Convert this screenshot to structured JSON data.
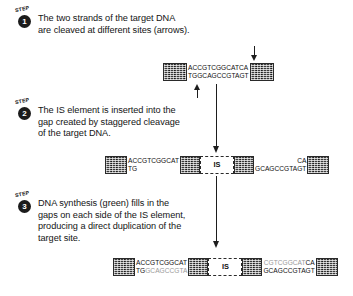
{
  "diagram": {
    "step_word": "STEP",
    "is_label": "IS",
    "accent_color": "#1b1b1b",
    "synthesis_color": "#9a9a9a"
  },
  "steps": [
    {
      "number": "1",
      "text": "The two strands of the target DNA\nare cleaved at different sites (arrows).",
      "dna": {
        "left_block": "target-dna-block",
        "sequence_top": "ACCGTCGGCATCA",
        "sequence_bottom": "TGGCAGCCGTAGT",
        "right_block": "target-dna-block"
      },
      "annotations": {
        "top_arrow": "cleavage-site-top-strand",
        "bottom_arrow": "cleavage-site-bottom-strand"
      }
    },
    {
      "number": "2",
      "text": "The IS element is inserted into the\ngap created by staggered cleavage\nof the target DNA.",
      "dna": {
        "left_block": "target-dna-block",
        "left_top": "ACCGTCGGCAT",
        "left_bottom": "TG",
        "is_left_flank": "is-inverted-repeat",
        "is_label": "IS",
        "is_right_flank": "is-inverted-repeat",
        "right_top": "CA",
        "right_bottom": "GCAGCCGTAGT",
        "right_block": "target-dna-block"
      }
    },
    {
      "number": "3",
      "text": "DNA synthesis (green) fills in the\ngaps on each side of the IS element,\nproducing a direct duplication of the\ntarget site.",
      "dna": {
        "left_block": "target-dna-block",
        "left_top": "ACCGTCGGCAT",
        "left_bottom_black": "TG",
        "left_bottom_green": "GCAGCCGTA",
        "is_left_flank": "is-inverted-repeat",
        "is_label": "IS",
        "is_right_flank": "is-inverted-repeat",
        "right_top_green": "CGTCGGCAT",
        "right_top_black": "CA",
        "right_bottom": "GCAGCCGTAGT",
        "right_block": "target-dna-block"
      }
    }
  ],
  "connectors": [
    {
      "name": "step1-to-step2-arrow"
    },
    {
      "name": "step2-to-step3-arrow"
    }
  ]
}
